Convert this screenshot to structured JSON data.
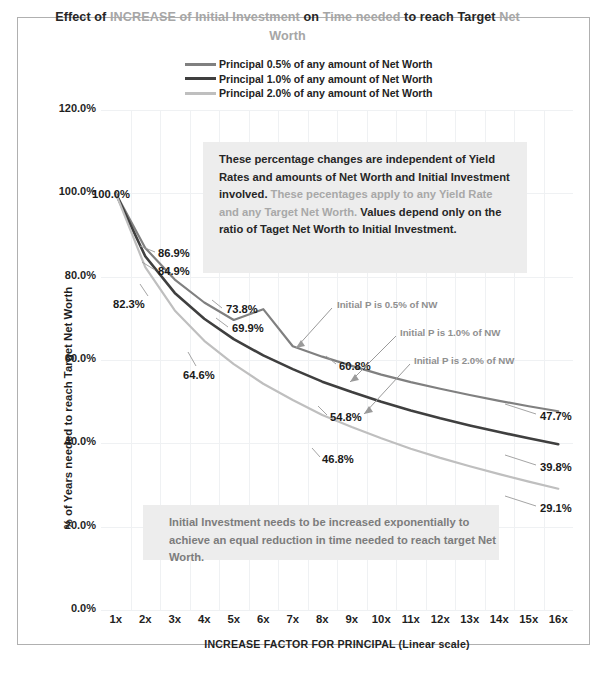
{
  "title": {
    "segments": [
      {
        "text": "Effect of ",
        "tone": "dark"
      },
      {
        "text": "INCREASE of Initial Investment ",
        "tone": "gray"
      },
      {
        "text": "on ",
        "tone": "dark"
      },
      {
        "text": "Time needed ",
        "tone": "gray"
      },
      {
        "text": "to reach Target ",
        "tone": "dark"
      },
      {
        "text": "Net Worth",
        "tone": "gray"
      }
    ],
    "plain": "Effect of INCREASE of Initial Investment on Time needed to reach Target Net Worth"
  },
  "legend": [
    {
      "label": "Principal 0.5% of any amount of Net Worth",
      "color": "#808080"
    },
    {
      "label": "Principal 1.0% of any amount of Net Worth",
      "color": "#3f3f3f"
    },
    {
      "label": "Principal 2.0% of any amount of Net Worth",
      "color": "#bfbfbf"
    }
  ],
  "notes": {
    "top": [
      {
        "text": "These percentage changes are independent of Yield Rates and amounts of Net Worth and Initial Investment involved. ",
        "tone": "dark"
      },
      {
        "text": "These pecentages apply to any Yield Rate and any Target Net Worth. ",
        "tone": "gray"
      },
      {
        "text": "Values depend only on the ratio of Taget Net Worth to Initial Investment.",
        "tone": "dark"
      }
    ],
    "bottom": "Initial Investment needs to be increased exponentially to achieve an equal reduction in time needed to reach target Net Worth."
  },
  "annotations": [
    {
      "text": "Initial P is 0.5% of NW",
      "x": 337,
      "y": 299
    },
    {
      "text": "Initial P is 1.0% of NW",
      "x": 400,
      "y": 327
    },
    {
      "text": "Initial P is 2.0% of NW",
      "x": 414,
      "y": 355
    }
  ],
  "point_labels": [
    {
      "text": "100.0%",
      "x": 92,
      "y": 188
    },
    {
      "text": "86.9%",
      "x": 158,
      "y": 247
    },
    {
      "text": "84.9%",
      "x": 158,
      "y": 265
    },
    {
      "text": "82.3%",
      "x": 113,
      "y": 298
    },
    {
      "text": "73.8%",
      "x": 226,
      "y": 303
    },
    {
      "text": "69.9%",
      "x": 232,
      "y": 322
    },
    {
      "text": "64.6%",
      "x": 183,
      "y": 369
    },
    {
      "text": "60.8%",
      "x": 339,
      "y": 360
    },
    {
      "text": "54.8%",
      "x": 330,
      "y": 411
    },
    {
      "text": "46.8%",
      "x": 322,
      "y": 453
    },
    {
      "text": "47.7%",
      "x": 540,
      "y": 410
    },
    {
      "text": "39.8%",
      "x": 540,
      "y": 461
    },
    {
      "text": "29.1%",
      "x": 540,
      "y": 502
    }
  ],
  "chart_data": {
    "type": "line",
    "title": "Effect of INCREASE of Initial Investment on Time needed to reach Target Net Worth",
    "xlabel": "INCREASE FACTOR FOR PRINCIPAL  (Linear scale)",
    "ylabel": "% of Years needed to reach Target Net Worth",
    "categories": [
      "1x",
      "2x",
      "3x",
      "4x",
      "5x",
      "6x",
      "7x",
      "8x",
      "9x",
      "10x",
      "11x",
      "12x",
      "13x",
      "14x",
      "15x",
      "16x"
    ],
    "x": [
      1,
      2,
      3,
      4,
      5,
      6,
      7,
      8,
      9,
      10,
      11,
      12,
      13,
      14,
      15,
      16
    ],
    "xlim": [
      1,
      16
    ],
    "ylim": [
      0,
      120
    ],
    "yticks": [
      "0.0%",
      "20.0%",
      "40.0%",
      "60.0%",
      "80.0%",
      "100.0%",
      "120.0%"
    ],
    "ytick_values": [
      0,
      20,
      40,
      60,
      80,
      100,
      120
    ],
    "grid": true,
    "legend_position": "top",
    "series": [
      {
        "name": "Principal 0.5% of any amount of Net Worth",
        "color": "#808080",
        "values": [
          100.0,
          86.9,
          79.3,
          73.8,
          69.6,
          72.2,
          63.3,
          60.8,
          58.6,
          56.5,
          54.7,
          53.1,
          51.6,
          50.2,
          48.9,
          47.7
        ],
        "labeled": {
          "1": "100.0%",
          "2": "86.9%",
          "4": "73.8%",
          "8": "60.8%",
          "16": "47.7%"
        }
      },
      {
        "name": "Principal 1.0% of any amount of Net Worth",
        "color": "#3f3f3f",
        "values": [
          100.0,
          84.9,
          76.1,
          69.9,
          65.0,
          61.1,
          57.8,
          54.8,
          52.3,
          50.0,
          47.9,
          46.0,
          44.3,
          42.7,
          41.2,
          39.8
        ],
        "labeled": {
          "1": "100.0%",
          "2": "84.9%",
          "4": "69.9%",
          "8": "54.8%",
          "16": "39.8%"
        }
      },
      {
        "name": "Principal 2.0% of any amount of Net Worth",
        "color": "#bfbfbf",
        "values": [
          100.0,
          82.3,
          71.9,
          64.6,
          59.0,
          54.3,
          50.4,
          46.8,
          43.9,
          41.2,
          38.7,
          36.5,
          34.5,
          32.6,
          30.8,
          29.1
        ],
        "labeled": {
          "1": "100.0%",
          "2": "82.3%",
          "4": "64.6%",
          "8": "46.8%",
          "16": "29.1%"
        }
      }
    ]
  }
}
